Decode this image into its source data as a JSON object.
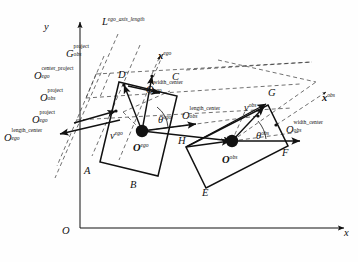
{
  "figure": {
    "type": "geometry-diagram",
    "background_color": "#fefefe",
    "line_color": "#111111",
    "axes": {
      "origin_label": "O",
      "x_label": "x",
      "y_label": "y"
    },
    "global_axis_labels": {
      "x": "x",
      "y": "y",
      "origin": "O"
    },
    "ego": {
      "center_label": "O",
      "center_sub": "ego",
      "heading_label": "θ",
      "heading_sub": "ego",
      "velocity_label": "v",
      "velocity_sub": "ego",
      "local_axis_label": "x",
      "local_axis_sub": "ego",
      "corners": [
        "A",
        "B",
        "C",
        "D"
      ],
      "axis_length_label": "L",
      "axis_length_sub": "ego_axis_length",
      "anchor_width_center": {
        "base": "O",
        "sup": "width_center",
        "sub": "ego"
      },
      "anchor_length_center": {
        "base": "O",
        "sup": "length_center",
        "sub": "ego"
      },
      "anchor_center_project": {
        "base": "O",
        "sup": "center_project",
        "sub": "ego"
      },
      "anchor_project": {
        "base": "O",
        "sup": "project",
        "sub": "ego"
      }
    },
    "obstacle": {
      "center_label": "O",
      "center_sub": "obs",
      "heading_label": "θ",
      "heading_sub": "obs",
      "velocity_label": "v",
      "velocity_sub": "obs",
      "local_axis_label": "x",
      "local_axis_sub": "obs",
      "corners": [
        "E",
        "F",
        "G",
        "H"
      ],
      "anchor_width_center": {
        "base": "O",
        "sup": "width_center",
        "sub": "obs"
      },
      "anchor_length_center": {
        "base": "O",
        "sup": "length_center",
        "sub": "obs"
      },
      "anchor_project": {
        "base": "O",
        "sup": "project",
        "sub": "obs"
      },
      "anchor_g_project": {
        "base": "G",
        "sup": "project",
        "sub": "obs"
      }
    }
  }
}
